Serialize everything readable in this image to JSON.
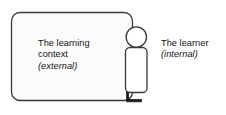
{
  "diagram": {
    "colors": {
      "stroke": "#3a3a3a",
      "fill": "#fcfcfc",
      "foot_fill": "#1a1a1a",
      "text": "#111111",
      "background": "#ffffff"
    },
    "context_box": {
      "label_lines": [
        "The learning",
        "context",
        "(external)"
      ],
      "line1": "The learning",
      "line2": "context",
      "line3": "(external)"
    },
    "learner_figure": {
      "label_lines": [
        "The learner",
        "(internal)"
      ],
      "line1": "The learner",
      "line2": "(internal)",
      "parts": {
        "head": "head-circle",
        "body": "body-rounded-rect",
        "foot": "foot-shape"
      }
    }
  }
}
